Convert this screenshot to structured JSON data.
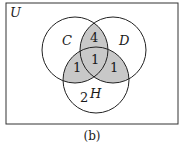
{
  "universe_label": "U",
  "sets": [
    {
      "name": "C",
      "label": "C"
    },
    {
      "name": "D",
      "label": "D"
    },
    {
      "name": "H",
      "label": "H"
    }
  ],
  "regions": {
    "C_and_D_only": "4",
    "C_and_D_and_H": "1",
    "C_and_H_only": "1",
    "D_and_H_only": "1",
    "H_only": "2"
  },
  "caption": "(b)",
  "colors": {
    "shade": "#c8c8c8",
    "stroke": "#222222"
  }
}
